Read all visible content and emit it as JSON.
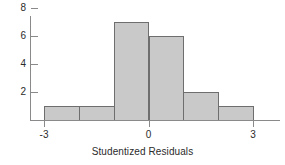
{
  "chart_data": {
    "type": "bar",
    "title": "",
    "subtitle": "",
    "xlabel": "Studentized Residuals",
    "ylabel": "",
    "grid": false,
    "legend": null,
    "legend_position": "none",
    "bin_edges": [
      -3,
      -2,
      -1,
      0,
      1,
      2,
      3
    ],
    "categories": [
      "-3 to -2",
      "-2 to -1",
      "-1 to 0",
      "0 to 1",
      "1 to 2",
      "2 to 3"
    ],
    "values": [
      1,
      1,
      7,
      6,
      2,
      1
    ],
    "bin_centers": [
      -2.5,
      -1.5,
      -0.5,
      0.5,
      1.5,
      2.5
    ],
    "xlim": [
      -3,
      3
    ],
    "ylim": [
      0,
      8.6
    ],
    "x_ticks": [
      {
        "value": -3,
        "label": "-3"
      },
      {
        "value": 0,
        "label": "0"
      },
      {
        "value": 3,
        "label": "3"
      }
    ],
    "y_ticks": [
      {
        "value": 2,
        "label": "2"
      },
      {
        "value": 4,
        "label": "4"
      },
      {
        "value": 6,
        "label": "6"
      },
      {
        "value": 8,
        "label": "8"
      }
    ],
    "colors": {
      "bar_fill": "#c9c9c9",
      "bar_edge": "#6e6e6e",
      "axis": "#8a8a8a",
      "text": "#2b2b2b",
      "background": "#ffffff"
    }
  }
}
